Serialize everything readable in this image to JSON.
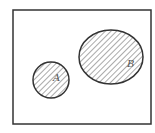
{
  "diagram": {
    "type": "venn",
    "universe": {
      "x": 13,
      "y": 10,
      "width": 138,
      "height": 114,
      "stroke": "#333333"
    },
    "sets": [
      {
        "label": "A",
        "shape": "circle",
        "cx": 51,
        "cy": 80,
        "rx": 18,
        "ry": 18,
        "label_x": 55,
        "label_y": 81,
        "hatched": true
      },
      {
        "label": "B",
        "shape": "ellipse",
        "cx": 111,
        "cy": 57,
        "rx": 32,
        "ry": 27,
        "label_x": 129,
        "label_y": 67,
        "hatched": true
      }
    ],
    "colors": {
      "stroke": "#333333",
      "hatch": "#555555",
      "background": "#ffffff"
    }
  }
}
